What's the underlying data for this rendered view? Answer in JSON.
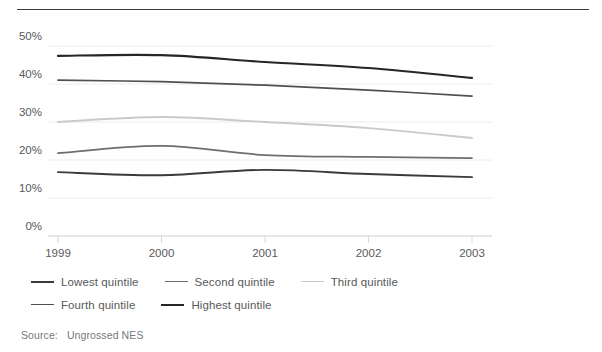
{
  "chart_data": {
    "type": "line",
    "title": "",
    "xlabel": "",
    "ylabel": "",
    "x": [
      "1999",
      "2000",
      "2001",
      "2002",
      "2003"
    ],
    "categories": [
      "1999",
      "2000",
      "2001",
      "2002",
      "2003"
    ],
    "ylim": [
      0,
      55
    ],
    "yticks": [
      0,
      10,
      20,
      30,
      40,
      50
    ],
    "ytick_labels": [
      "0%",
      "10%",
      "20%",
      "30%",
      "40%",
      "50%"
    ],
    "grid": true,
    "legend_position": "bottom-left",
    "series": [
      {
        "name": "Lowest quintile",
        "values": [
          16.8,
          16.0,
          17.4,
          16.3,
          15.5
        ],
        "color": "#3a3a3c",
        "width": 1.9
      },
      {
        "name": "Second quintile",
        "values": [
          21.8,
          23.7,
          21.3,
          20.8,
          20.5
        ],
        "color": "#6d6e70",
        "width": 1.7
      },
      {
        "name": "Third quintile",
        "values": [
          30.0,
          31.3,
          30.0,
          28.4,
          25.8
        ],
        "color": "#c9cacb",
        "width": 1.9
      },
      {
        "name": "Fourth quintile",
        "values": [
          41.0,
          40.6,
          39.7,
          38.4,
          36.8
        ],
        "color": "#4f5052",
        "width": 1.7
      },
      {
        "name": "Highest quintile",
        "values": [
          47.4,
          47.6,
          45.8,
          44.2,
          41.6
        ],
        "color": "#262628",
        "width": 2.1
      }
    ]
  },
  "source": {
    "label": "Source:",
    "text": "Ungrossed NES"
  },
  "legend": {
    "items": [
      {
        "label": "Lowest quintile"
      },
      {
        "label": "Second quintile"
      },
      {
        "label": "Third quintile"
      },
      {
        "label": "Fourth quintile"
      },
      {
        "label": "Highest quintile"
      }
    ]
  },
  "axis": {
    "y_labels": [
      "50%",
      "40%",
      "30%",
      "20%",
      "10%",
      "0%"
    ],
    "x_labels": [
      "1999",
      "2000",
      "2001",
      "2002",
      "2003"
    ]
  },
  "colors": {
    "grid": "#ececed",
    "axis": "#d8d9da",
    "text": "#58595b",
    "rule": "#3a3a3c"
  }
}
